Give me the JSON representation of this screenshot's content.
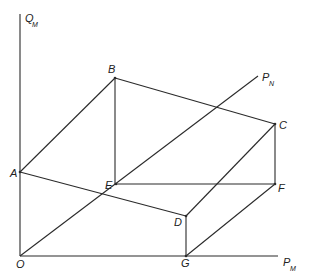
{
  "diagram": {
    "axes": {
      "y_label": "Q",
      "y_label_sub": "M",
      "x_label": "P",
      "x_label_sub": "M",
      "diag_label": "P",
      "diag_label_sub": "N"
    },
    "points": {
      "O": "O",
      "A": "A",
      "B": "B",
      "C": "C",
      "D": "D",
      "E": "E",
      "F": "F",
      "G": "G"
    },
    "colors": {
      "line": "#2a2a2a",
      "background": "#ffffff"
    }
  }
}
